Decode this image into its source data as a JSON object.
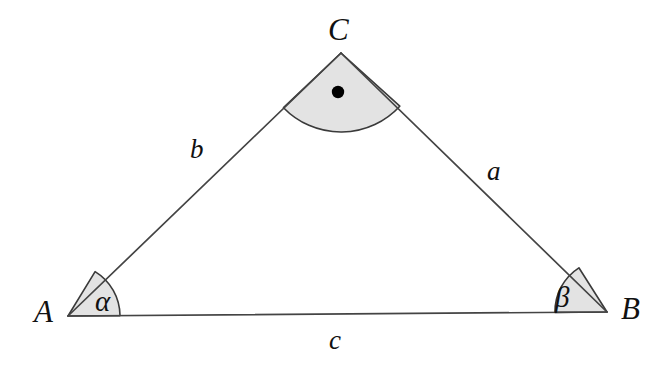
{
  "figure": {
    "type": "geometry-diagram",
    "background_color": "#ffffff",
    "stroke_color": "#444444",
    "sector_fill_color": "#e3e3e3",
    "sector_stroke_color": "#3a3a3a",
    "marker_dot_color": "#000000"
  },
  "vertices": [
    {
      "id": "C",
      "label": "C",
      "x": 341,
      "y": 53,
      "label_x": 328,
      "label_y": 14
    },
    {
      "id": "A",
      "label": "A",
      "x": 68,
      "y": 316,
      "label_x": 34,
      "label_y": 296
    },
    {
      "id": "B",
      "label": "B",
      "x": 607,
      "y": 312,
      "label_x": 621,
      "label_y": 293
    }
  ],
  "sides": [
    {
      "id": "b",
      "label": "b",
      "from": "A",
      "to": "C",
      "label_x": 190,
      "label_y": 136
    },
    {
      "id": "a",
      "label": "a",
      "from": "C",
      "to": "B",
      "label_x": 487,
      "label_y": 158
    },
    {
      "id": "c",
      "label": "c",
      "from": "A",
      "to": "B",
      "label_x": 329,
      "label_y": 327
    }
  ],
  "angles": [
    {
      "id": "alpha",
      "at_vertex": "A",
      "label": "α",
      "marker": "shaded-sector",
      "radius": 52,
      "label_x": 95,
      "label_y": 287
    },
    {
      "id": "beta",
      "at_vertex": "B",
      "label": "β",
      "marker": "shaded-sector",
      "radius": 52,
      "label_x": 555,
      "label_y": 283
    },
    {
      "id": "gamma",
      "at_vertex": "C",
      "label": "",
      "marker": "shaded-sector-with-dot",
      "radius": 55,
      "dot_x": 338,
      "dot_y": 92,
      "dot_radius": 6
    }
  ]
}
